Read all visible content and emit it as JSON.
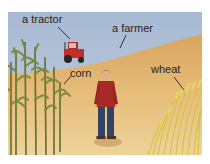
{
  "scene": {
    "description": "Illustrated farm scene: a farmer standing in a field between corn and wheat with a tractor on the hill",
    "colors": {
      "sky": "#a9bcd6",
      "field": "#e2b46c",
      "field_light": "#ecc98a",
      "corn": "#6b7a3a",
      "wheat": "#d9c84a",
      "tractor": "#c0302a",
      "farmer_shirt": "#a82a26",
      "farmer_pants": "#2f4466"
    }
  },
  "labels": {
    "tractor": "a tractor",
    "farmer": "a farmer",
    "corn": "corn",
    "wheat": "wheat"
  }
}
